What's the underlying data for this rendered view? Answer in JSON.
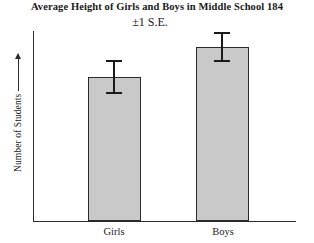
{
  "chart_data": {
    "type": "bar",
    "title": "Average Height of Girls and Boys in Middle School 184",
    "subtitle": "±1 S.E.",
    "categories": [
      "Girls",
      "Boys"
    ],
    "values": [
      144,
      174
    ],
    "errors": [
      17,
      15
    ],
    "series": [
      {
        "name": "Number of Students",
        "values": [
          144,
          174
        ],
        "error_low": [
          17,
          15
        ],
        "error_high": [
          17,
          15
        ]
      }
    ],
    "xlabel": "",
    "ylabel": "Number of Students",
    "ylim": [
      0,
      190
    ],
    "grid": false,
    "legend": false,
    "axis_ticks_y": [],
    "axis_ticks_x": [
      "Girls",
      "Boys"
    ],
    "bar_fill_color": "#c9c9c9",
    "bar_edge_color": "#2b2b2b",
    "axis_color": "#2b2b2b",
    "error_bar_color": "#1a1a1a",
    "background_color": "#ffffff",
    "annotations": [
      "±1 S.E."
    ]
  },
  "axes": {
    "y_label": "Number of Students",
    "y_arrow_icon": "up-arrow-icon"
  },
  "labels": {
    "girls": "Girls",
    "boys": "Boys"
  }
}
